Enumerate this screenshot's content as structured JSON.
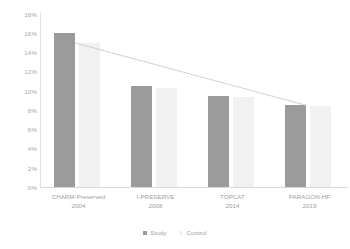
{
  "chart_data": {
    "type": "bar",
    "title": "",
    "subtitle": "",
    "xlabel": "",
    "ylabel": "",
    "ylim": [
      0,
      18
    ],
    "grid": false,
    "legend_position": "bottom",
    "categories": [
      "CHARM-Preserved",
      "I-PRESERVE",
      "TOPCAT",
      "PARAGON-HF"
    ],
    "category_years": [
      "2004",
      "2008",
      "2014",
      "2019"
    ],
    "ytick_labels": [
      "18%",
      "16%",
      "14%",
      "12%",
      "10%",
      "8%",
      "6%",
      "4%",
      "2%",
      "0%"
    ],
    "ytick_values": [
      18,
      16,
      14,
      12,
      10,
      8,
      6,
      4,
      2,
      0
    ],
    "series": [
      {
        "name": "Study",
        "color": "#9b9b9b",
        "values": [
          16.0,
          10.5,
          9.5,
          8.5
        ]
      },
      {
        "name": "Control",
        "color": "#f1f1f1",
        "values": [
          15.0,
          10.3,
          9.4,
          8.4
        ]
      }
    ],
    "trendline": {
      "name": "trend",
      "style": "dotted",
      "color": "#c9c9c9",
      "start_value": 15.0,
      "end_value": 8.5
    }
  },
  "legend": {
    "items": [
      {
        "label": "Study",
        "color": "#9b9b9b"
      },
      {
        "label": "Control",
        "color": "#f1f1f1"
      }
    ]
  }
}
